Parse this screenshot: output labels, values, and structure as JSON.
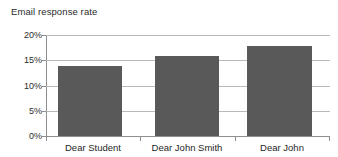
{
  "chart_data": {
    "type": "bar",
    "title": "Email response rate",
    "xlabel": "",
    "ylabel": "",
    "categories": [
      "Dear Student",
      "Dear John Smith",
      "Dear John"
    ],
    "values": [
      13.9,
      15.8,
      17.8
    ],
    "ylim": [
      0,
      20
    ],
    "yticks": [
      0,
      5,
      10,
      15,
      20
    ],
    "ytick_labels": [
      "0%",
      "5%",
      "10%",
      "15%",
      "20%"
    ],
    "grid": true,
    "legend": "none",
    "bar_color": "#595959",
    "gridline_color": "#b9b9b9",
    "axis_color": "#8f8f8f",
    "background_color": "#ffffff"
  }
}
